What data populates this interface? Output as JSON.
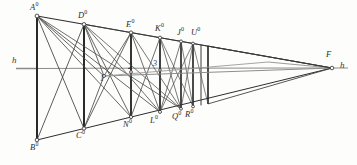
{
  "figure": {
    "type": "geometric-line-drawing",
    "background_color": "#fdfdfc",
    "line_color": "#3a3a3a",
    "heavy_line_color": "#1f1f1f",
    "horizon": {
      "left_label": "h",
      "right_label": "h",
      "vanishing_point_label": "F",
      "y": 68,
      "left_x": 16,
      "right_x": 348
    },
    "top_labels": [
      {
        "text": "A",
        "sup": "0",
        "x": 30,
        "y": 6
      },
      {
        "text": "D",
        "sup": "0",
        "x": 78,
        "y": 11
      },
      {
        "text": "E",
        "sup": "0",
        "x": 127,
        "y": 19
      },
      {
        "text": "K",
        "sup": "0",
        "x": 155,
        "y": 21
      },
      {
        "text": "J",
        "sup": "0",
        "x": 176,
        "y": 26
      },
      {
        "text": "U",
        "sup": "0",
        "x": 193,
        "y": 25
      }
    ],
    "bottom_labels": [
      {
        "text": "B",
        "sup": "0",
        "x": 30,
        "y": 143
      },
      {
        "text": "C",
        "sup": "0",
        "x": 75,
        "y": 131
      },
      {
        "text": "N",
        "sup": "0",
        "x": 122,
        "y": 121
      },
      {
        "text": "L",
        "sup": "0",
        "x": 148,
        "y": 117
      },
      {
        "text": "Q",
        "sup": "0",
        "x": 173,
        "y": 113
      },
      {
        "text": "R",
        "sup": "0",
        "x": 186,
        "y": 111
      }
    ],
    "interior_numerals": [
      {
        "text": "1",
        "x": 104,
        "y": 73
      },
      {
        "text": "2",
        "x": 130,
        "y": 69
      },
      {
        "text": "3",
        "x": 154,
        "y": 66
      }
    ],
    "vertical_edges": [
      {
        "name": "A0B0",
        "x": 37,
        "y_top": 16,
        "y_bottom": 140,
        "weight": "heavy"
      },
      {
        "name": "D0C0",
        "x": 84,
        "y_top": 24,
        "y_bottom": 128,
        "weight": "heavy"
      },
      {
        "name": "E0N0",
        "x": 131,
        "y_top": 32,
        "y_bottom": 117,
        "weight": "heavy"
      },
      {
        "name": "K0L0",
        "x": 160,
        "y_top": 36,
        "y_bottom": 112,
        "weight": "heavy"
      },
      {
        "name": "J0Q0",
        "x": 181,
        "y_top": 39,
        "y_bottom": 109,
        "weight": "heavy"
      },
      {
        "name": "U0R0",
        "x": 193,
        "y_top": 41,
        "y_bottom": 107,
        "weight": "heavy"
      },
      {
        "name": "edge-7",
        "x": 201,
        "y_top": 42,
        "y_bottom": 105,
        "weight": "light"
      },
      {
        "name": "edge-8",
        "x": 208,
        "y_top": 43,
        "y_bottom": 104,
        "weight": "heavy"
      }
    ]
  }
}
